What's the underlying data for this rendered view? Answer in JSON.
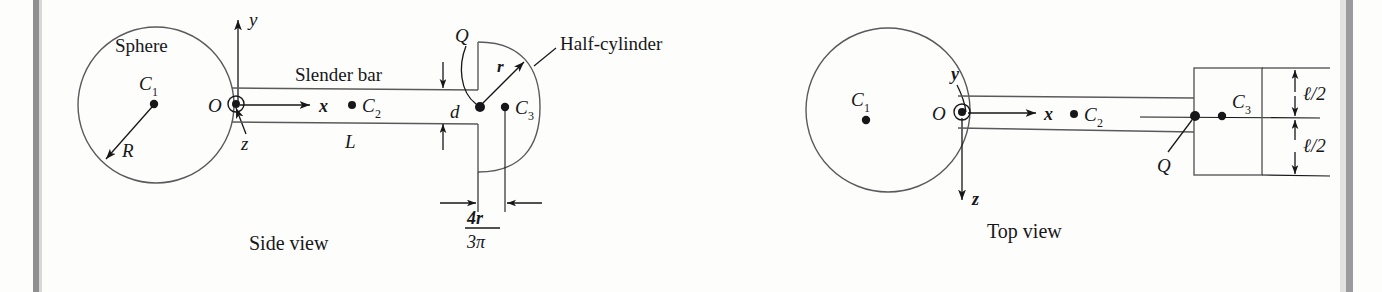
{
  "figure": {
    "background_color": "#fdfdfc",
    "ink_color": "#17171a",
    "line_color": "#5a5a5c",
    "scan_edge_color": "#9a9a9c",
    "views": [
      {
        "name": "side-view",
        "caption": "Side view",
        "labels": {
          "sphere": "Sphere",
          "sphere_center": "C",
          "sphere_center_sub": "1",
          "sphere_radius": "R",
          "origin": "O",
          "axis_y": "y",
          "axis_x": "x",
          "axis_z": "z",
          "bar": "Slender bar",
          "bar_center": "C",
          "bar_center_sub": "2",
          "bar_length": "L",
          "bar_depth": "d",
          "point_q": "Q",
          "cyl_radius": "r",
          "half_cylinder": "Half-cylinder",
          "cyl_center": "C",
          "cyl_center_sub": "3",
          "centroid_num": "4r",
          "centroid_den": "3π"
        }
      },
      {
        "name": "top-view",
        "caption": "Top view",
        "labels": {
          "sphere_center": "C",
          "sphere_center_sub": "1",
          "origin": "O",
          "axis_y": "y",
          "axis_x": "x",
          "axis_z": "z",
          "bar_center": "C",
          "bar_center_sub": "2",
          "point_q": "Q",
          "cyl_center": "C",
          "cyl_center_sub": "3",
          "half_length_upper": "ℓ/2",
          "half_length_lower": "ℓ/2"
        }
      }
    ]
  }
}
